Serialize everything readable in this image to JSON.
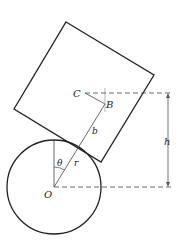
{
  "diagram": {
    "labels": {
      "C": "C",
      "B": "B",
      "b": "b",
      "h": "h",
      "theta": "θ",
      "r": "r",
      "O": "O"
    },
    "colors": {
      "stroke": "#222222",
      "guide": "#555555"
    }
  }
}
